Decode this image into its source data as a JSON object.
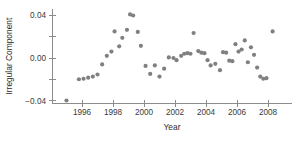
{
  "chart_data": {
    "type": "scatter",
    "title": "",
    "xlabel": "Year",
    "ylabel": "Irregular Component",
    "xlim": [
      1994.7,
      2008.8
    ],
    "ylim": [
      -0.05,
      0.05
    ],
    "xticks": [
      1996,
      1998,
      2000,
      2002,
      2004,
      2006,
      2008
    ],
    "xticklabels": [
      "1996",
      "1998",
      "2000",
      "2002",
      "2004",
      "2006",
      "2008"
    ],
    "yticks": [
      -0.04,
      -0.02,
      0.0,
      0.02,
      0.04
    ],
    "yticklabels": [
      "-0.04",
      "",
      "0.00",
      "",
      "0.04"
    ],
    "ylabels_shown": [
      "0.04",
      "0.00",
      "-0.04"
    ],
    "grid": false,
    "legend": null,
    "marker": {
      "shape": "circle",
      "color": "#808080",
      "size": 3
    },
    "series": [
      {
        "name": "Irregular Component",
        "points": [
          {
            "x": 1995.0,
            "y": -0.04
          },
          {
            "x": 1995.8,
            "y": -0.02
          },
          {
            "x": 1996.1,
            "y": -0.0195
          },
          {
            "x": 1996.4,
            "y": -0.0185
          },
          {
            "x": 1996.7,
            "y": -0.0175
          },
          {
            "x": 1997.0,
            "y": -0.0155
          },
          {
            "x": 1997.3,
            "y": -0.006
          },
          {
            "x": 1997.6,
            "y": 0.002
          },
          {
            "x": 1997.9,
            "y": 0.006
          },
          {
            "x": 1998.1,
            "y": 0.025
          },
          {
            "x": 1998.4,
            "y": 0.011
          },
          {
            "x": 1998.6,
            "y": 0.019
          },
          {
            "x": 1998.9,
            "y": 0.0265
          },
          {
            "x": 1999.1,
            "y": 0.041
          },
          {
            "x": 1999.3,
            "y": 0.04
          },
          {
            "x": 1999.6,
            "y": 0.0245
          },
          {
            "x": 1999.8,
            "y": 0.0115
          },
          {
            "x": 2000.1,
            "y": -0.0075
          },
          {
            "x": 2000.4,
            "y": -0.015
          },
          {
            "x": 2000.7,
            "y": -0.007
          },
          {
            "x": 2001.0,
            "y": -0.0175
          },
          {
            "x": 2001.3,
            "y": -0.01
          },
          {
            "x": 2001.6,
            "y": 0.0005
          },
          {
            "x": 2001.9,
            "y": 0.0
          },
          {
            "x": 2002.1,
            "y": -0.002
          },
          {
            "x": 2002.4,
            "y": 0.002
          },
          {
            "x": 2002.6,
            "y": 0.004
          },
          {
            "x": 2002.8,
            "y": 0.0045
          },
          {
            "x": 2003.0,
            "y": 0.004
          },
          {
            "x": 2003.2,
            "y": 0.0235
          },
          {
            "x": 2003.5,
            "y": 0.0065
          },
          {
            "x": 2003.7,
            "y": 0.005
          },
          {
            "x": 2003.9,
            "y": 0.0045
          },
          {
            "x": 2004.1,
            "y": -0.002
          },
          {
            "x": 2004.3,
            "y": -0.007
          },
          {
            "x": 2004.6,
            "y": -0.0055
          },
          {
            "x": 2004.9,
            "y": -0.0115
          },
          {
            "x": 2005.1,
            "y": 0.0055
          },
          {
            "x": 2005.3,
            "y": 0.005
          },
          {
            "x": 2005.5,
            "y": -0.0025
          },
          {
            "x": 2005.7,
            "y": -0.003
          },
          {
            "x": 2005.9,
            "y": 0.013
          },
          {
            "x": 2006.1,
            "y": 0.006
          },
          {
            "x": 2006.3,
            "y": 0.008
          },
          {
            "x": 2006.5,
            "y": 0.0165
          },
          {
            "x": 2006.7,
            "y": -0.004
          },
          {
            "x": 2006.9,
            "y": 0.01
          },
          {
            "x": 2007.1,
            "y": 0.003
          },
          {
            "x": 2007.3,
            "y": -0.009
          },
          {
            "x": 2007.5,
            "y": -0.0175
          },
          {
            "x": 2007.7,
            "y": -0.0195
          },
          {
            "x": 2007.9,
            "y": -0.019
          },
          {
            "x": 2008.3,
            "y": 0.025
          }
        ]
      }
    ]
  }
}
